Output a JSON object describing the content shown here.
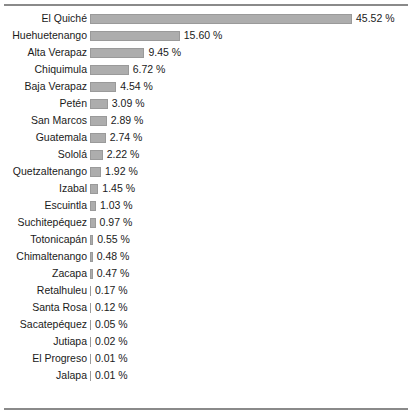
{
  "chart_data": {
    "type": "bar",
    "orientation": "horizontal",
    "title": "",
    "xlabel": "",
    "ylabel": "",
    "unit": "%",
    "value_suffix": " %",
    "xlim": [
      0,
      45.52
    ],
    "grid": false,
    "legend": false,
    "bar_color": "#adadad",
    "bar_border_color": "#9a9a9a",
    "frame_color": "#8a8a8a",
    "text_color": "#1a1a1a",
    "background": "#ffffff",
    "categories": [
      "El Quiché",
      "Huehuetenango",
      "Alta Verapaz",
      "Chiquimula",
      "Baja Verapaz",
      "Petén",
      "San Marcos",
      "Guatemala",
      "Sololá",
      "Quetzaltenango",
      "Izabal",
      "Escuintla",
      "Suchitepéquez",
      "Totonicapán",
      "Chimaltenango",
      "Zacapa",
      "Retalhuleu",
      "Santa Rosa",
      "Sacatepéquez",
      "Jutiapa",
      "El Progreso",
      "Jalapa"
    ],
    "values": [
      45.52,
      15.6,
      9.45,
      6.72,
      4.54,
      3.09,
      2.89,
      2.74,
      2.22,
      1.92,
      1.45,
      1.03,
      0.97,
      0.55,
      0.48,
      0.47,
      0.17,
      0.12,
      0.05,
      0.02,
      0.01,
      0.01
    ],
    "value_labels": [
      "45.52 %",
      "15.60 %",
      "9.45 %",
      "6.72 %",
      "4.54 %",
      "3.09 %",
      "2.89 %",
      "2.74 %",
      "2.22 %",
      "1.92 %",
      "1.45 %",
      "1.03 %",
      "0.97 %",
      "0.55 %",
      "0.48 %",
      "0.47 %",
      "0.17 %",
      "0.12 %",
      "0.05 %",
      "0.02 %",
      "0.01 %",
      "0.01 %"
    ]
  }
}
